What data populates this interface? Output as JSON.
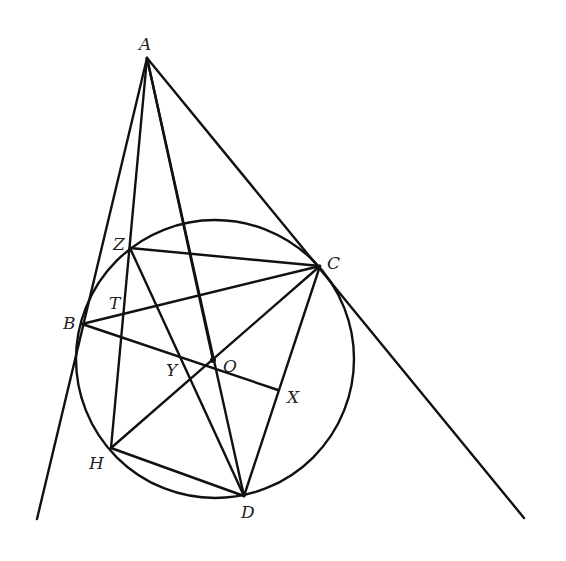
{
  "figure": {
    "circle": {
      "center": "O",
      "cx": 215,
      "cy": 359,
      "r": 140
    },
    "points": {
      "A": {
        "label": "A",
        "x": 147,
        "y": 58
      },
      "B": {
        "label": "B",
        "x": 82,
        "y": 324
      },
      "C": {
        "label": "C",
        "x": 320,
        "y": 266
      },
      "D": {
        "label": "D",
        "x": 244,
        "y": 496
      },
      "H": {
        "label": "H",
        "x": 111,
        "y": 448
      },
      "Z": {
        "label": "Z",
        "x": 130,
        "y": 248
      },
      "O": {
        "label": "O",
        "x": 213,
        "y": 360
      },
      "X": {
        "label": "X",
        "x": 278,
        "y": 390
      },
      "Y": {
        "label": "Y",
        "x": 186,
        "y": 358
      },
      "T": {
        "label": "T",
        "x": 116,
        "y": 308
      }
    },
    "segments": [
      [
        "A",
        "B-ext"
      ],
      [
        "A",
        "C-ext"
      ],
      [
        "A",
        "H"
      ],
      [
        "A",
        "D"
      ],
      [
        "A",
        "O"
      ],
      [
        "Z",
        "C"
      ],
      [
        "Z",
        "H"
      ],
      [
        "Z",
        "D"
      ],
      [
        "B",
        "C"
      ],
      [
        "B",
        "X"
      ],
      [
        "C",
        "H"
      ],
      [
        "C",
        "D"
      ],
      [
        "H",
        "D"
      ]
    ]
  }
}
